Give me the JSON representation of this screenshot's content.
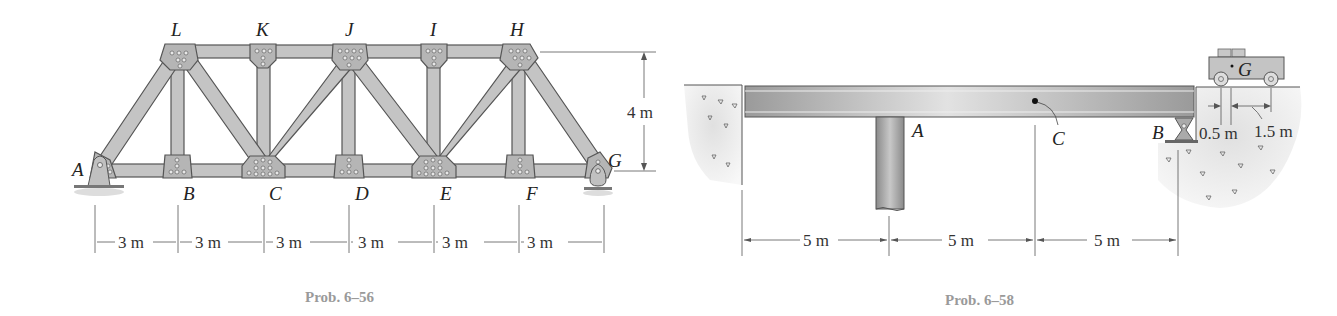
{
  "figures": [
    {
      "caption": "Prob. 6–56",
      "type": "truss",
      "top_joints": [
        "L",
        "K",
        "J",
        "I",
        "H"
      ],
      "bottom_joints": [
        "A",
        "B",
        "C",
        "D",
        "E",
        "F",
        "G"
      ],
      "labels": {
        "A": "A",
        "B": "B",
        "C": "C",
        "D": "D",
        "E": "E",
        "F": "F",
        "G": "G",
        "H": "H",
        "I": "I",
        "J": "J",
        "K": "K",
        "L": "L"
      },
      "height_dim": "4 m",
      "span_dims": [
        "3 m",
        "3 m",
        "3 m",
        "3 m",
        "3 m",
        "3 m"
      ]
    },
    {
      "caption": "Prob. 6–58",
      "type": "beam-with-cart",
      "labels": {
        "A": "A",
        "B": "B",
        "C": "C",
        "G": "G"
      },
      "span_dims": [
        "5 m",
        "5 m",
        "5 m"
      ],
      "cart_dims": [
        "0.5 m",
        "1.5 m"
      ]
    }
  ],
  "colors": {
    "member_fill": "#c4c4c4",
    "member_stroke": "#555555",
    "plate_fill": "#b5b5b5",
    "beam_fill": "#b0b0b0",
    "soil_fill": "#e6e6e6",
    "caption": "#9a9a9a"
  }
}
